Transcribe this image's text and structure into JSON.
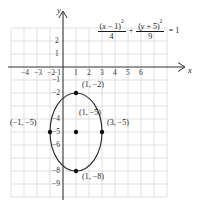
{
  "figure": {
    "type": "coordinate-graph",
    "axis_labels": {
      "x": "x",
      "y": "y"
    },
    "equation": {
      "term1": {
        "numerator": "(x − 1)",
        "numerator_exponent": "2",
        "denominator": "4"
      },
      "operator": "+",
      "term2": {
        "numerator": "(y + 5)",
        "numerator_exponent": "2",
        "denominator": "9"
      },
      "equals": "= 1",
      "full_text": "(x − 1)²/4 + (y + 5)²/9 = 1"
    },
    "x_ticks": [
      "−4",
      "−3",
      "−2",
      "−1",
      "1",
      "2",
      "3",
      "4",
      "5",
      "6"
    ],
    "y_ticks": [
      "2",
      "1",
      "−1",
      "−2",
      "−4",
      "−5",
      "−6",
      "−8",
      "−9"
    ],
    "point_labels": [
      {
        "name": "top-vertex",
        "text": "(1, −2)"
      },
      {
        "name": "left-vertex",
        "text": "(−1, −5)"
      },
      {
        "name": "center",
        "text": "(1, −5)"
      },
      {
        "name": "right-vertex",
        "text": "(3, −5)"
      },
      {
        "name": "bottom-vertex",
        "text": "(1, −8)"
      }
    ]
  },
  "chart_data": {
    "type": "scatter",
    "title": "",
    "xlabel": "x",
    "ylabel": "y",
    "xlim": [
      -5,
      7
    ],
    "ylim": [
      -10,
      3
    ],
    "grid": true,
    "legend": "none",
    "curve": {
      "kind": "ellipse",
      "equation": "(x - 1)^2/4 + (y + 5)^2/9 = 1",
      "center": [
        1,
        -5
      ],
      "semi_axis_x": 2,
      "semi_axis_y": 3,
      "orientation": "vertical-major"
    },
    "points": [
      {
        "x": 1,
        "y": -2,
        "label": "(1, −2)"
      },
      {
        "x": -1,
        "y": -5,
        "label": "(−1, −5)"
      },
      {
        "x": 1,
        "y": -5,
        "label": "(1, −5)"
      },
      {
        "x": 3,
        "y": -5,
        "label": "(3, −5)"
      },
      {
        "x": 1,
        "y": -8,
        "label": "(1, −8)"
      }
    ],
    "xticks": [
      -4,
      -3,
      -2,
      -1,
      1,
      2,
      3,
      4,
      5,
      6
    ],
    "yticks": [
      2,
      1,
      -1,
      -2,
      -4,
      -5,
      -6,
      -8,
      -9
    ],
    "colors": {
      "curve": "#333333",
      "grid": "#c9c9c9",
      "axis": "#333333",
      "point": "#111111"
    }
  }
}
